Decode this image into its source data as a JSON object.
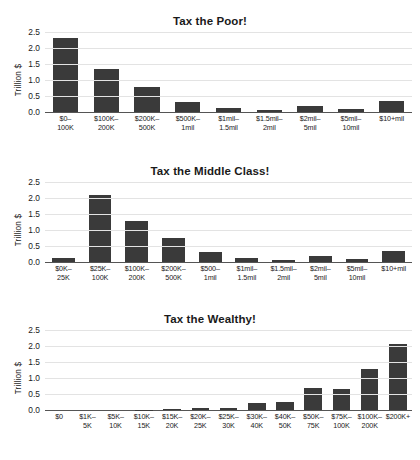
{
  "page": {
    "background_color": "#ffffff",
    "bar_color": "#3a3a3a",
    "axis_color": "#555555",
    "grid_color": "#e3e3e3"
  },
  "chart_data": [
    {
      "type": "bar",
      "title": "Tax the Poor!",
      "xlabel": "",
      "ylabel": "Trillion $",
      "ylim": [
        0.0,
        2.5
      ],
      "yticks": [
        0.0,
        0.5,
        1.0,
        1.5,
        2.0,
        2.5
      ],
      "ytick_labels": [
        "0.0",
        "0.5",
        "1.0",
        "1.5",
        "2.0",
        "2.5"
      ],
      "grid": true,
      "legend": "none",
      "categories": [
        "$0–\n100K",
        "$100K–\n200K",
        "$200K–\n500K",
        "$500K–\n1mil",
        "$1mil–\n1.5mil",
        "$1.5mil–\n2mil",
        "$2mil–\n5mil",
        "$5mil–\n10mil",
        "$10+mil"
      ],
      "category_lines": [
        [
          "$0–",
          "100K"
        ],
        [
          "$100K–",
          "200K"
        ],
        [
          "$200K–",
          "500K"
        ],
        [
          "$500K–",
          "1mil"
        ],
        [
          "$1mil–",
          "1.5mil"
        ],
        [
          "$1.5mil–",
          "2mil"
        ],
        [
          "$2mil–",
          "5mil"
        ],
        [
          "$5mil–",
          "10mil"
        ],
        [
          "$10+mil",
          ""
        ]
      ],
      "values": [
        2.3,
        1.33,
        0.78,
        0.32,
        0.14,
        0.06,
        0.2,
        0.1,
        0.33
      ]
    },
    {
      "type": "bar",
      "title": "Tax the Middle Class!",
      "xlabel": "",
      "ylabel": "Trillion $",
      "ylim": [
        0.0,
        2.5
      ],
      "yticks": [
        0.0,
        0.5,
        1.0,
        1.5,
        2.0,
        2.5
      ],
      "ytick_labels": [
        "0.0",
        "0.5",
        "1.0",
        "1.5",
        "2.0",
        "2.5"
      ],
      "grid": true,
      "legend": "none",
      "categories": [
        "$0K–\n25K",
        "$25K–\n100K",
        "$100K–\n200K",
        "$200K–\n500K",
        "$500–\n1mil",
        "$1mil–\n1.5mil",
        "$1.5mil–\n2mil",
        "$2mil–\n5mil",
        "$5mil–\n10mil",
        "$10+mil"
      ],
      "category_lines": [
        [
          "$0K–",
          "25K"
        ],
        [
          "$25K–",
          "100K"
        ],
        [
          "$100K–",
          "200K"
        ],
        [
          "$200K–",
          "500K"
        ],
        [
          "$500–",
          "1mil"
        ],
        [
          "$1mil–",
          "1.5mil"
        ],
        [
          "$1.5mil–",
          "2mil"
        ],
        [
          "$2mil–",
          "5mil"
        ],
        [
          "$5mil–",
          "10mil"
        ],
        [
          "$10+mil",
          ""
        ]
      ],
      "values": [
        0.14,
        2.09,
        1.28,
        0.76,
        0.32,
        0.13,
        0.06,
        0.2,
        0.1,
        0.33
      ]
    },
    {
      "type": "bar",
      "title": "Tax the Wealthy!",
      "xlabel": "",
      "ylabel": "Trillion $",
      "ylim": [
        0.0,
        2.5
      ],
      "yticks": [
        0.0,
        0.5,
        1.0,
        1.5,
        2.0,
        2.5
      ],
      "ytick_labels": [
        "0.0",
        "0.5",
        "1.0",
        "1.5",
        "2.0",
        "2.5"
      ],
      "grid": true,
      "legend": "none",
      "categories": [
        "$0",
        "$1K–\n5K",
        "$5K–\n10K",
        "$10K–\n15K",
        "$15K–\n20K",
        "$20K–\n25K",
        "$25K–\n30K",
        "$30K–\n40K",
        "$40K–\n50K",
        "$50K–\n75K",
        "$75K–\n100K",
        "$100K–\n200K",
        "$200K+"
      ],
      "category_lines": [
        [
          "$0",
          ""
        ],
        [
          "$1K–",
          "5K"
        ],
        [
          "$5K–",
          "10K"
        ],
        [
          "$10K–",
          "15K"
        ],
        [
          "$15K–",
          "20K"
        ],
        [
          "$20K–",
          "25K"
        ],
        [
          "$25K–",
          "30K"
        ],
        [
          "$30K–",
          "40K"
        ],
        [
          "$40K–",
          "50K"
        ],
        [
          "$50K–",
          "75K"
        ],
        [
          "$75K–",
          "100K"
        ],
        [
          "$100K–",
          "200K"
        ],
        [
          "$200K+",
          ""
        ]
      ],
      "values": [
        0.0,
        0.0,
        0.0,
        0.01,
        0.03,
        0.05,
        0.07,
        0.21,
        0.25,
        0.69,
        0.65,
        1.28,
        2.06
      ]
    }
  ]
}
